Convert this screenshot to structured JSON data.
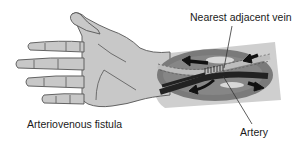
{
  "diagram": {
    "title": "Arteriovenous fistula",
    "labels": {
      "vein": "Nearest adjacent vein",
      "fistula": "Arteriovenous fistula",
      "artery": "Artery"
    },
    "components": [
      {
        "name": "hand-and-forearm",
        "description": "Left hand and forearm, palm up"
      },
      {
        "name": "fistula-window",
        "description": "Oval cutaway on forearm showing anastomosis"
      },
      {
        "name": "vein",
        "description": "Light vessel with dashed border running across window"
      },
      {
        "name": "artery",
        "description": "Dark vessel crossing the vein"
      },
      {
        "name": "anastomosis",
        "description": "Stitched junction where artery meets vein"
      },
      {
        "name": "flow-arrows",
        "count": 5,
        "description": "Black arrows showing blood flow direction"
      }
    ],
    "colors": {
      "skin": "#c8c8c8",
      "skin_outline": "#555555",
      "forearm_band": "#cfcfcf",
      "window_bg": "#7a7a7a",
      "vein": "#bdbdbd",
      "artery": "#222222",
      "arrow": "#111111",
      "text": "#1a1a1a"
    }
  }
}
